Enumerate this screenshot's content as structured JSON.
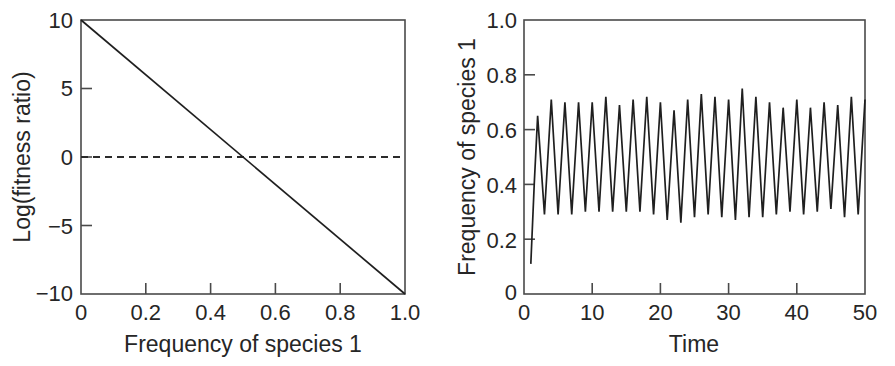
{
  "figure": {
    "background": "#ffffff",
    "ink_color": "#262626",
    "line_color": "#1f1f1f"
  },
  "chart_data": [
    {
      "panel": "left",
      "type": "line",
      "title": "",
      "xlabel": "Frequency of species 1",
      "ylabel": "Log(fitness ratio)",
      "xlim": [
        0,
        1.0
      ],
      "ylim": [
        -10,
        10
      ],
      "xticks": [
        0,
        0.2,
        0.4,
        0.6,
        0.8,
        1.0
      ],
      "xticklabels": [
        "0",
        "0.2",
        "0.4",
        "0.6",
        "0.8",
        "1.0"
      ],
      "yticks": [
        10,
        5,
        0,
        -5,
        -10
      ],
      "yticklabels": [
        "10",
        "5",
        "0",
        "−5",
        "−10"
      ],
      "grid": false,
      "legend": "none",
      "series": [
        {
          "name": "log fitness ratio",
          "style": "solid",
          "x": [
            0,
            1.0
          ],
          "values": [
            10,
            -10
          ]
        },
        {
          "name": "zero reference",
          "style": "dashed",
          "x": [
            0,
            1.0
          ],
          "values": [
            0,
            0
          ]
        }
      ],
      "annotations": [
        "line crosses zero at frequency 0.5"
      ]
    },
    {
      "panel": "right",
      "type": "line",
      "title": "",
      "xlabel": "Time",
      "ylabel": "Frequency of species 1",
      "xlim": [
        0,
        50
      ],
      "ylim": [
        0,
        1.0
      ],
      "xticks": [
        0,
        10,
        20,
        30,
        40,
        50
      ],
      "xticklabels": [
        "0",
        "10",
        "20",
        "30",
        "40",
        "50"
      ],
      "yticks": [
        0,
        0.2,
        0.4,
        0.6,
        0.8,
        1.0
      ],
      "yticklabels": [
        "0",
        "0.2",
        "0.4",
        "0.6",
        "0.8",
        "1.0"
      ],
      "grid": false,
      "legend": "none",
      "series": [
        {
          "name": "frequency of species 1",
          "style": "solid",
          "x": [
            1.0,
            1.5,
            2.0,
            3.0,
            4.0,
            5.0,
            6.0,
            7.0,
            8.0,
            9.0,
            10.0,
            11.0,
            12.0,
            13.0,
            14.0,
            15.0,
            16.0,
            17.0,
            18.0,
            19.0,
            20.0,
            21.0,
            22.0,
            23.0,
            24.0,
            25.0,
            26.0,
            27.0,
            28.0,
            29.0,
            30.0,
            31.0,
            32.0,
            33.0,
            34.0,
            35.0,
            36.0,
            37.0,
            38.0,
            39.0,
            40.0,
            41.0,
            42.0,
            43.0,
            44.0,
            45.0,
            46.0,
            47.0,
            48.0,
            49.0,
            50.0
          ],
          "values": [
            0.11,
            0.4,
            0.65,
            0.29,
            0.71,
            0.29,
            0.7,
            0.29,
            0.7,
            0.3,
            0.7,
            0.3,
            0.72,
            0.3,
            0.69,
            0.3,
            0.71,
            0.3,
            0.72,
            0.29,
            0.7,
            0.27,
            0.67,
            0.26,
            0.71,
            0.28,
            0.73,
            0.29,
            0.72,
            0.28,
            0.71,
            0.27,
            0.75,
            0.28,
            0.72,
            0.28,
            0.7,
            0.29,
            0.68,
            0.3,
            0.71,
            0.29,
            0.68,
            0.3,
            0.7,
            0.31,
            0.69,
            0.28,
            0.72,
            0.29,
            0.71
          ]
        }
      ],
      "annotations": [
        "stable limit-cycle oscillation, period approximately 2 time units",
        "peaks range about 0.67 to 0.75",
        "troughs range about 0.26 to 0.31",
        "trajectory begins near 0.11 at time 1"
      ]
    }
  ]
}
